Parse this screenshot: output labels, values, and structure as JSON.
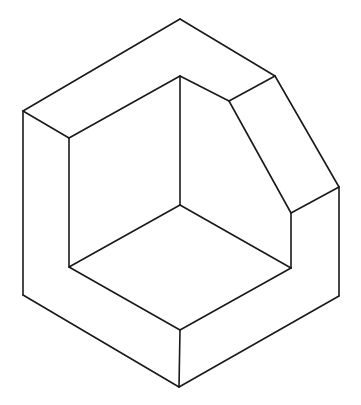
{
  "figure": {
    "type": "isometric-line-drawing",
    "stroke_color": "#1a1a1a",
    "background_color": "#ffffff",
    "edges": [
      [
        180,
        19,
        23,
        111
      ],
      [
        180,
        19,
        275,
        76
      ],
      [
        23,
        111,
        69,
        138
      ],
      [
        69,
        138,
        180,
        76
      ],
      [
        180,
        76,
        229,
        101
      ],
      [
        229,
        101,
        275,
        76
      ],
      [
        275,
        76,
        339,
        187
      ],
      [
        229,
        101,
        291,
        213
      ],
      [
        291,
        213,
        339,
        187
      ],
      [
        23,
        111,
        23,
        295
      ],
      [
        69,
        138,
        69,
        267
      ],
      [
        180,
        76,
        180,
        205
      ],
      [
        339,
        187,
        339,
        296
      ],
      [
        291,
        213,
        291,
        268
      ],
      [
        180,
        205,
        69,
        267
      ],
      [
        180,
        205,
        291,
        268
      ],
      [
        69,
        267,
        180,
        330
      ],
      [
        291,
        268,
        180,
        330
      ],
      [
        23,
        295,
        179,
        387
      ],
      [
        339,
        296,
        179,
        387
      ],
      [
        180,
        330,
        179,
        387
      ]
    ]
  }
}
